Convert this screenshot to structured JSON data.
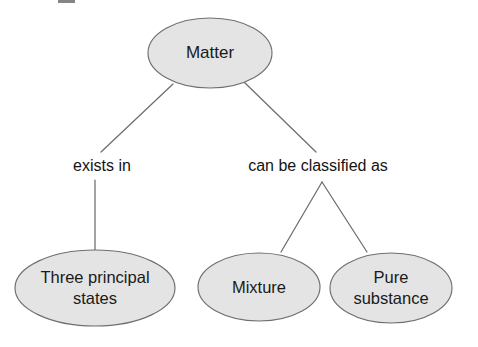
{
  "diagram": {
    "type": "concept-map",
    "background_color": "#ffffff",
    "node_fill_color": "#e4e4e4",
    "node_stroke_color": "#6f6f6f",
    "connector_color": "#6d6d6d",
    "text_color": "#1a1a1a",
    "nodes": [
      {
        "id": "matter",
        "label": "Matter",
        "lines": [
          "Matter"
        ],
        "cx": 210,
        "cy": 53,
        "rx": 62,
        "ry": 35
      },
      {
        "id": "three-principal-states",
        "label": "Three principal states",
        "lines": [
          "Three principal",
          "states"
        ],
        "cx": 95,
        "cy": 288,
        "rx": 80,
        "ry": 38
      },
      {
        "id": "mixture",
        "label": "Mixture",
        "lines": [
          "Mixture"
        ],
        "cx": 259,
        "cy": 287,
        "rx": 61,
        "ry": 34
      },
      {
        "id": "pure-substance",
        "label": "Pure substance",
        "lines": [
          "Pure",
          "substance"
        ],
        "cx": 391,
        "cy": 288,
        "rx": 61,
        "ry": 35
      }
    ],
    "edge_labels": [
      {
        "id": "exists-in",
        "text": "exists in",
        "x": 102,
        "y": 167
      },
      {
        "id": "can-be-classified-as",
        "text": "can be classified as",
        "x": 318,
        "y": 167
      }
    ],
    "edges": [
      {
        "id": "matter-to-exists-in",
        "from": "matter",
        "to": "exists in",
        "x1": 173,
        "y1": 84,
        "x2": 101,
        "y2": 152
      },
      {
        "id": "matter-to-classified",
        "from": "matter",
        "to": "can be classified as",
        "x1": 244,
        "y1": 82,
        "x2": 316,
        "y2": 152
      },
      {
        "id": "exists-in-to-states",
        "from": "exists in",
        "to": "Three principal states",
        "x1": 95,
        "y1": 180,
        "x2": 95,
        "y2": 251
      },
      {
        "id": "classified-to-mixture",
        "from": "can be classified as",
        "to": "Mixture",
        "x1": 322,
        "y1": 182,
        "x2": 281,
        "y2": 252
      },
      {
        "id": "classified-to-pure",
        "from": "can be classified as",
        "to": "Pure substance",
        "x1": 322,
        "y1": 182,
        "x2": 367,
        "y2": 252
      }
    ]
  }
}
